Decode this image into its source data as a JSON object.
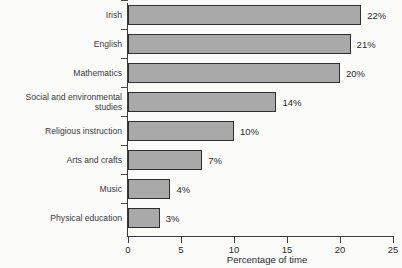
{
  "chart_data": {
    "type": "bar",
    "orientation": "horizontal",
    "title": "",
    "subtitle": "",
    "xlabel": "Percentage of time",
    "ylabel": "",
    "xlim": [
      0,
      25
    ],
    "xticks": [
      0,
      5,
      10,
      15,
      20,
      25
    ],
    "xtick_labels": [
      "0",
      "5",
      "10",
      "15",
      "20",
      "25"
    ],
    "grid": false,
    "legend": null,
    "categories": [
      "Irish",
      "English",
      "Mathematics",
      "Social and environmental\nstudies",
      "Religious instruction",
      "Arts and crafts",
      "Music",
      "Physical education"
    ],
    "values": [
      22,
      21,
      20,
      14,
      10,
      7,
      4,
      3
    ],
    "value_labels": [
      "22%",
      "21%",
      "20%",
      "14%",
      "10%",
      "7%",
      "4%",
      "3%"
    ],
    "colors": {
      "bar_fill": "#a9a9a9",
      "bar_border": "#2e2e2e",
      "axis": "#3b3b3b",
      "text": "#2b2b2b",
      "background": "#fbfbfa"
    }
  }
}
